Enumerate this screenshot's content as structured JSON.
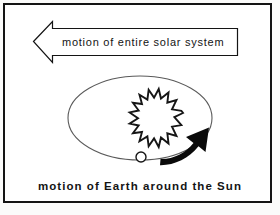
{
  "figure": {
    "title_hidden": "",
    "background_color": "#fbfbfa",
    "frame_color": "#141414",
    "ink_color": "#141414",
    "paper_color": "#ffffff"
  },
  "solar_arrow": {
    "label": "motion of entire solar system",
    "direction": "left",
    "style": "outline",
    "stroke_color": "#141414",
    "fill_color": "#ffffff"
  },
  "orbit": {
    "shape": "ellipse",
    "stroke_color": "#555555",
    "center_x": 140,
    "center_y": 118,
    "radius_x": 72,
    "radius_y": 42
  },
  "sun": {
    "name": "sun",
    "style": "jagged-ring",
    "spike_count": 16,
    "center_x": 162,
    "center_y": 113,
    "inner_radius": 13,
    "outer_radius": 21,
    "stroke_color": "#141414"
  },
  "earth": {
    "name": "earth",
    "style": "hollow-circle",
    "center_x": 141,
    "center_y": 157,
    "radius": 5,
    "stroke_color": "#141414",
    "fill_color": "#ffffff"
  },
  "orbit_direction_arrow": {
    "name": "orbit-direction-arrow",
    "style": "solid-curved",
    "direction": "counterclockwise-toward-upper-right",
    "fill_color": "#0a0a0a"
  },
  "caption": {
    "text": "motion of Earth around the Sun"
  }
}
